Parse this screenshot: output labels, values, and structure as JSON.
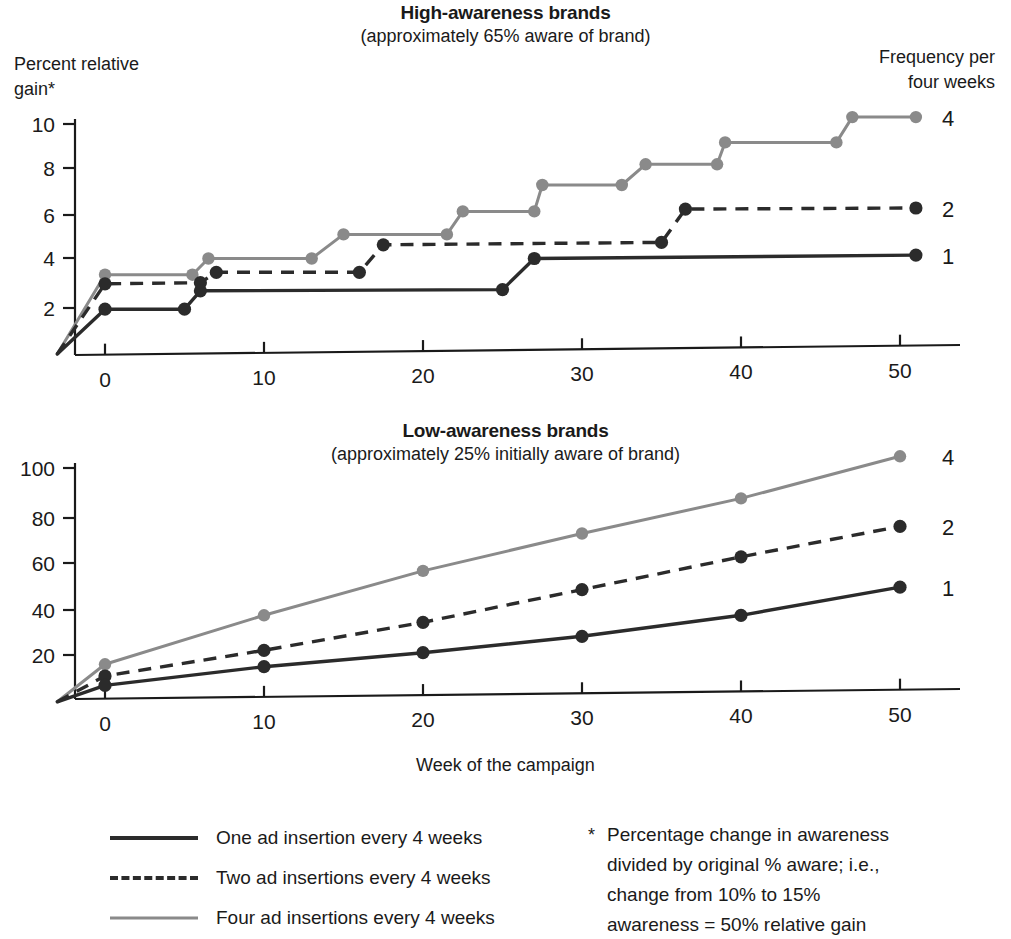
{
  "figure": {
    "x_axis_caption": "Week of the campaign",
    "y_axis_caption": "Percent relative\ngain*",
    "frequency_caption": "Frequency per\nfour weeks"
  },
  "legend": {
    "items": [
      {
        "label": "One ad insertion every 4 weeks",
        "style": "solid-dark",
        "swatch": "solid-dark-line-icon"
      },
      {
        "label": "Two ad insertions every 4 weeks",
        "style": "dashed-dark",
        "swatch": "dashed-dark-line-icon"
      },
      {
        "label": "Four ad insertions every 4 weeks",
        "style": "solid-gray",
        "swatch": "solid-gray-line-icon"
      }
    ]
  },
  "footnote": {
    "marker": "*",
    "text": "Percentage change in awareness\ndivided by original % aware; i.e.,\nchange from 10% to 15%\nawareness = 50% relative gain"
  },
  "colors": {
    "series_1": "#2b2b2b",
    "series_2": "#2b2b2b",
    "series_4": "#8a8a8a",
    "axis": "#1a1a1a"
  },
  "chart_data": [
    {
      "id": "high-awareness",
      "type": "line",
      "title": "High-awareness brands",
      "subtitle": "(approximately 65% aware of brand)",
      "xlabel": "Week of the campaign",
      "ylabel": "Percent relative gain*",
      "xlim": [
        -3,
        53
      ],
      "ylim": [
        0,
        11
      ],
      "xticks": [
        0,
        10,
        20,
        30,
        40,
        50
      ],
      "yticks": [
        2,
        4,
        6,
        8,
        10
      ],
      "grid": false,
      "legend_position": "right-of-plot",
      "series": [
        {
          "name": "1",
          "legend_label": "One ad insertion every 4 weeks",
          "style": "solid-dark",
          "label_y": 4.3,
          "x": [
            -3,
            0,
            5,
            6,
            25,
            27,
            51
          ],
          "values": [
            0,
            1.95,
            1.95,
            2.75,
            2.8,
            4.15,
            4.3
          ]
        },
        {
          "name": "2",
          "legend_label": "Two ad insertions every 4 weeks",
          "style": "dashed-dark",
          "label_y": 6.35,
          "x": [
            -3,
            0,
            6,
            7,
            16,
            17.5,
            35,
            36.5,
            51
          ],
          "values": [
            0,
            3.05,
            3.1,
            3.55,
            3.55,
            4.75,
            4.85,
            6.3,
            6.35
          ]
        },
        {
          "name": "4",
          "legend_label": "Four ad insertions every 4 weeks",
          "style": "solid-gray",
          "label_y": 10.3,
          "x": [
            -3,
            0,
            5.5,
            6.5,
            13,
            15,
            21.5,
            22.5,
            27,
            27.5,
            32.5,
            34,
            38.5,
            39,
            46,
            47,
            51
          ],
          "values": [
            0,
            3.45,
            3.45,
            4.15,
            4.15,
            5.2,
            5.2,
            6.2,
            6.2,
            7.35,
            7.35,
            8.25,
            8.25,
            9.2,
            9.2,
            10.3,
            10.3
          ]
        }
      ]
    },
    {
      "id": "low-awareness",
      "type": "line",
      "title": "Low-awareness brands",
      "subtitle": "(approximately 25% initially aware of brand)",
      "xlabel": "Week of the campaign",
      "ylabel": "Percent relative gain*",
      "xlim": [
        -3,
        53
      ],
      "ylim": [
        0,
        110
      ],
      "xticks": [
        0,
        10,
        20,
        30,
        40,
        50
      ],
      "yticks": [
        20,
        40,
        60,
        80,
        100
      ],
      "grid": false,
      "legend_position": "right-of-plot",
      "series": [
        {
          "name": "1",
          "legend_label": "One ad insertion every 4 weeks",
          "style": "solid-dark",
          "label_y": 49,
          "x": [
            -3,
            0,
            10,
            20,
            30,
            40,
            50
          ],
          "values": [
            0,
            7,
            15,
            21,
            28,
            37,
            49
          ]
        },
        {
          "name": "2",
          "legend_label": "Two ad insertions every 4 weeks",
          "style": "dashed-dark",
          "label_y": 75,
          "x": [
            -3,
            0,
            10,
            20,
            30,
            40,
            50
          ],
          "values": [
            0,
            11,
            22,
            34,
            48,
            62,
            75
          ]
        },
        {
          "name": "4",
          "legend_label": "Four ad insertions every 4 weeks",
          "style": "solid-gray",
          "label_y": 105,
          "x": [
            -3,
            0,
            10,
            20,
            30,
            40,
            50
          ],
          "values": [
            0,
            16,
            37,
            56,
            72,
            87,
            105
          ]
        }
      ]
    }
  ]
}
